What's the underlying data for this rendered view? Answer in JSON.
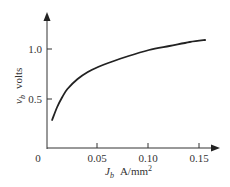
{
  "chart_data": {
    "type": "line",
    "title": "",
    "xlabel": "J_b  A/mm²",
    "ylabel": "v_b  volts",
    "xlim": [
      0,
      0.16
    ],
    "ylim": [
      0,
      1.2
    ],
    "grid": false,
    "x_ticks": [
      "0",
      "0.05",
      "0.10",
      "0.15"
    ],
    "y_ticks": [
      "0.5",
      "1.0"
    ],
    "series": [
      {
        "name": "v_b vs J_b",
        "x": [
          0.005,
          0.01,
          0.015,
          0.02,
          0.03,
          0.04,
          0.05,
          0.06,
          0.08,
          0.1,
          0.12,
          0.14,
          0.155
        ],
        "y": [
          0.29,
          0.42,
          0.52,
          0.6,
          0.7,
          0.77,
          0.82,
          0.86,
          0.93,
          0.99,
          1.03,
          1.07,
          1.09
        ]
      }
    ]
  },
  "axes": {
    "origin_label": "0",
    "x_tick_labels": [
      "0.05",
      "0.10",
      "0.15"
    ],
    "y_tick_labels": [
      "0.5",
      "1.0"
    ],
    "x_label_main": "J",
    "x_label_sub": "b",
    "x_label_units": "A/mm",
    "x_label_sup": "2",
    "y_label_main": "v",
    "y_label_sub": "b",
    "y_label_units": "volts"
  }
}
